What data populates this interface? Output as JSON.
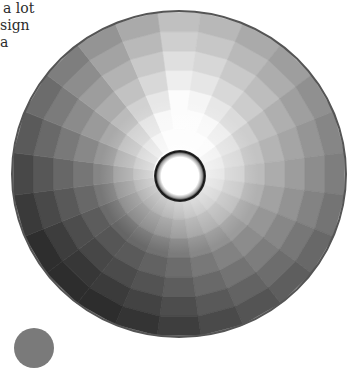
{
  "text_fragment": {
    "lines": [
      "a lot",
      "sign",
      "a"
    ],
    "color": "#2b2b2b"
  },
  "wheel": {
    "description": "Grayscale color wheel with 24 hue wedges and 7 concentric value rings around a central hole",
    "center": [
      179,
      174
    ],
    "radius_x": 167,
    "radius_y": 163,
    "hole_radius": 26,
    "wedge_count": 24,
    "ring_count": 7,
    "start_angle_deg": -97.5,
    "wedge_base_lightness": [
      248,
      240,
      226,
      214,
      200,
      190,
      182,
      172,
      160,
      150,
      140,
      130,
      118,
      108,
      100,
      96,
      102,
      114,
      128,
      146,
      164,
      182,
      204,
      226
    ],
    "ring_lightness_drop": 17,
    "center_glow": "#ffffff",
    "rim_color": "#555555",
    "hole_ring_color": "#111111"
  },
  "corner_disc": {
    "color": "#7a7a7a"
  }
}
